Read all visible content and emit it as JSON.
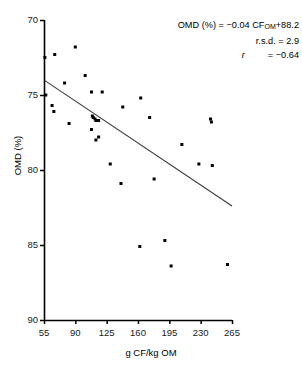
{
  "chart_data": {
    "type": "scatter",
    "title": "",
    "xlabel": "g CF/kg OM",
    "ylabel": "OMD (%)",
    "xlim": [
      55,
      265
    ],
    "ylim": [
      70,
      90
    ],
    "xticks": [
      55,
      90,
      125,
      160,
      195,
      230,
      265
    ],
    "yticks": [
      70,
      75,
      80,
      85,
      90
    ],
    "grid": false,
    "legend": false,
    "marker": "filled-square",
    "marker_color": "#000000",
    "points": [
      {
        "x": 56,
        "y": 87.5
      },
      {
        "x": 57,
        "y": 85.0
      },
      {
        "x": 67,
        "y": 87.7
      },
      {
        "x": 64,
        "y": 84.3
      },
      {
        "x": 66,
        "y": 83.9
      },
      {
        "x": 78,
        "y": 85.8
      },
      {
        "x": 90,
        "y": 88.2
      },
      {
        "x": 83,
        "y": 83.1
      },
      {
        "x": 101,
        "y": 86.3
      },
      {
        "x": 108,
        "y": 85.2
      },
      {
        "x": 120,
        "y": 85.2
      },
      {
        "x": 109,
        "y": 83.6
      },
      {
        "x": 110,
        "y": 83.5
      },
      {
        "x": 112,
        "y": 83.4
      },
      {
        "x": 113,
        "y": 83.3
      },
      {
        "x": 116,
        "y": 83.3
      },
      {
        "x": 108,
        "y": 82.7
      },
      {
        "x": 116,
        "y": 82.2
      },
      {
        "x": 113,
        "y": 82.0
      },
      {
        "x": 143,
        "y": 84.2
      },
      {
        "x": 163,
        "y": 84.8
      },
      {
        "x": 173,
        "y": 83.5
      },
      {
        "x": 129,
        "y": 80.4
      },
      {
        "x": 141,
        "y": 79.1
      },
      {
        "x": 178,
        "y": 79.4
      },
      {
        "x": 209,
        "y": 81.7
      },
      {
        "x": 228,
        "y": 80.4
      },
      {
        "x": 241,
        "y": 83.4
      },
      {
        "x": 242,
        "y": 83.2
      },
      {
        "x": 243,
        "y": 80.3
      },
      {
        "x": 162,
        "y": 74.9
      },
      {
        "x": 190,
        "y": 75.3
      },
      {
        "x": 197,
        "y": 73.6
      },
      {
        "x": 260,
        "y": 73.7
      }
    ],
    "fit_line": {
      "slope": -0.04,
      "intercept": 88.2,
      "x_start": 56,
      "x_end": 265,
      "y_start": 85.96,
      "y_end": 77.6
    },
    "annotation": {
      "equation_prefix": "OMD (%) = −0.04 CF",
      "equation_sub": "OM",
      "equation_suffix": "+88.2",
      "rsd_label": "r.s.d. =",
      "rsd_value": "2.9",
      "r_label": "r",
      "r_eq": "=",
      "r_value": "−0.64"
    }
  },
  "axis": {
    "y_tick_labels": [
      "90",
      "85",
      "80",
      "75",
      "70"
    ],
    "x_tick_labels": [
      "55",
      "90",
      "125",
      "160",
      "195",
      "230",
      "265"
    ],
    "y_title": "OMD (%)",
    "x_title": "g CF/kg OM"
  },
  "colors": {
    "axis": "#000000",
    "marker": "#000000",
    "line": "#3a3a3a",
    "background": "#ffffff"
  }
}
